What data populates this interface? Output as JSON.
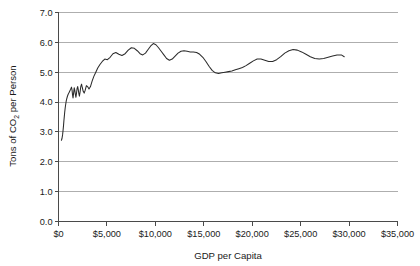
{
  "chart_data": {
    "type": "line",
    "title": "",
    "subtitle": "",
    "xlabel": "GDP per Capita",
    "ylabel": "Tons of CO2 per Person",
    "ylabel_parts": {
      "prefix": "Tons of CO",
      "subscript": "2",
      "suffix": " per Person"
    },
    "xlim": [
      0,
      35000
    ],
    "ylim": [
      0,
      7
    ],
    "xtick_values": [
      0,
      5000,
      10000,
      15000,
      20000,
      25000,
      30000,
      35000
    ],
    "xtick_labels": [
      "$0",
      "$5,000",
      "$10,000",
      "$15,000",
      "$20,000",
      "$25,000",
      "$30,000",
      "$35,000"
    ],
    "ytick_values": [
      0,
      1,
      2,
      3,
      4,
      5,
      6,
      7
    ],
    "ytick_labels": [
      "0.0",
      "1.0",
      "2.0",
      "3.0",
      "4.0",
      "5.0",
      "6.0",
      "7.0"
    ],
    "grid": {
      "horizontal": true,
      "vertical": false,
      "color": "#9a9a9a"
    },
    "legend": {
      "visible": false,
      "position": "none",
      "entries": []
    },
    "annotations": [],
    "series": [
      {
        "name": "CO2 per Person",
        "color": "#2b2b2b",
        "line_width": 1.05,
        "marker": "none",
        "x": [
          300,
          360,
          420,
          470,
          520,
          560,
          600,
          640,
          690,
          740,
          790,
          840,
          900,
          950,
          1000,
          1060,
          1120,
          1180,
          1240,
          1290,
          1340,
          1400,
          1450,
          1500,
          1560,
          1620,
          1680,
          1740,
          1800,
          1860,
          1920,
          1980,
          2040,
          2100,
          2160,
          2230,
          2300,
          2380,
          2460,
          2550,
          2650,
          2760,
          2880,
          3000,
          3150,
          3300,
          3470,
          3650,
          3850,
          4050,
          4280,
          4520,
          4780,
          5050,
          5330,
          5620,
          5920,
          6230,
          6550,
          6880,
          7200,
          7520,
          7830,
          8130,
          8420,
          8700,
          8980,
          9250,
          9520,
          9790,
          10060,
          10330,
          10600,
          10880,
          11160,
          11450,
          11740,
          12040,
          12340,
          12650,
          12960,
          13280,
          13600,
          13930,
          14260,
          14580,
          14900,
          15220,
          15540,
          15860,
          16190,
          16520,
          16860,
          17200,
          17550,
          17900,
          18260,
          18620,
          18990,
          19360,
          19740,
          20120,
          20510,
          20900,
          21300,
          21700,
          22110,
          22520,
          22940,
          23360,
          23790,
          24220,
          24660,
          25100,
          25550,
          26000,
          26460,
          26920,
          27380,
          27840,
          28300,
          28760,
          29200,
          29500
        ],
        "y": [
          2.72,
          2.78,
          2.9,
          3.05,
          3.22,
          3.38,
          3.52,
          3.66,
          3.8,
          3.92,
          4.02,
          4.1,
          4.17,
          4.22,
          4.26,
          4.3,
          4.34,
          4.38,
          4.42,
          4.46,
          4.5,
          4.4,
          4.24,
          4.14,
          4.3,
          4.48,
          4.4,
          4.26,
          4.16,
          4.3,
          4.46,
          4.52,
          4.42,
          4.28,
          4.2,
          4.34,
          4.52,
          4.6,
          4.48,
          4.36,
          4.3,
          4.4,
          4.55,
          4.52,
          4.44,
          4.52,
          4.7,
          4.86,
          5.0,
          5.14,
          5.26,
          5.36,
          5.44,
          5.42,
          5.5,
          5.62,
          5.66,
          5.6,
          5.56,
          5.62,
          5.74,
          5.82,
          5.8,
          5.72,
          5.62,
          5.58,
          5.64,
          5.76,
          5.88,
          5.96,
          5.92,
          5.82,
          5.7,
          5.58,
          5.46,
          5.4,
          5.44,
          5.54,
          5.64,
          5.7,
          5.72,
          5.7,
          5.68,
          5.68,
          5.66,
          5.6,
          5.5,
          5.36,
          5.2,
          5.06,
          4.98,
          4.96,
          4.98,
          5.0,
          5.02,
          5.04,
          5.08,
          5.12,
          5.16,
          5.22,
          5.3,
          5.38,
          5.44,
          5.44,
          5.4,
          5.36,
          5.36,
          5.42,
          5.52,
          5.64,
          5.72,
          5.76,
          5.74,
          5.68,
          5.6,
          5.52,
          5.46,
          5.44,
          5.46,
          5.5,
          5.54,
          5.58,
          5.58,
          5.52
        ]
      }
    ]
  }
}
